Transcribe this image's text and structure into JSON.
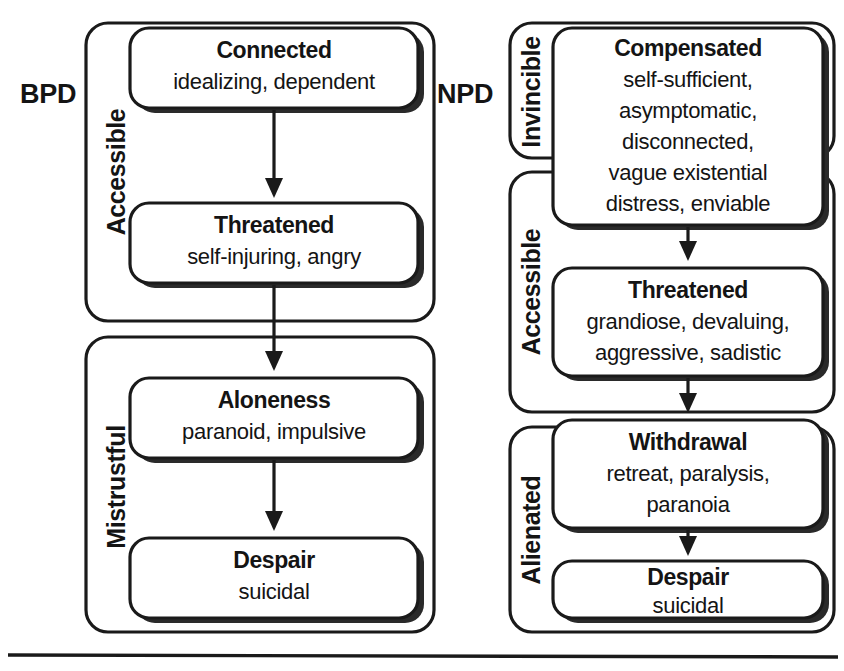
{
  "figure": {
    "bottom_rule": true
  },
  "columns": [
    {
      "id": "bpd",
      "label": "BPD",
      "groups": [
        {
          "id": "bpd-accessible",
          "label": "Accessible",
          "nodes": [
            {
              "id": "bpd-connected",
              "title": "Connected",
              "desc_lines": [
                "idealizing, dependent"
              ]
            },
            {
              "id": "bpd-threatened",
              "title": "Threatened",
              "desc_lines": [
                "self-injuring, angry"
              ]
            }
          ]
        },
        {
          "id": "bpd-mistrustful",
          "label": "Mistrustful",
          "nodes": [
            {
              "id": "bpd-aloneness",
              "title": "Aloneness",
              "desc_lines": [
                "paranoid, impulsive"
              ]
            },
            {
              "id": "bpd-despair",
              "title": "Despair",
              "desc_lines": [
                "suicidal"
              ]
            }
          ]
        }
      ]
    },
    {
      "id": "npd",
      "label": "NPD",
      "groups": [
        {
          "id": "npd-invincible",
          "label": "Invincible",
          "nodes": [
            {
              "id": "npd-compensated",
              "title": "Compensated",
              "desc_lines": [
                "self-sufficient,",
                "asymptomatic,",
                "disconnected,",
                "vague existential",
                "distress, enviable"
              ]
            }
          ]
        },
        {
          "id": "npd-accessible",
          "label": "Accessible",
          "nodes": [
            {
              "id": "npd-threatened",
              "title": "Threatened",
              "desc_lines": [
                "grandiose, devaluing,",
                "aggressive, sadistic"
              ]
            }
          ]
        },
        {
          "id": "npd-alienated",
          "label": "Alienated",
          "nodes": [
            {
              "id": "npd-withdrawal",
              "title": "Withdrawal",
              "desc_lines": [
                "retreat, paralysis,",
                "paranoia"
              ]
            },
            {
              "id": "npd-despair",
              "title": "Despair",
              "desc_lines": [
                "suicidal"
              ]
            }
          ]
        }
      ]
    }
  ],
  "flow_arrows": [
    {
      "id": "bpd-connected-to-threatened",
      "from": "Connected",
      "to": "Threatened"
    },
    {
      "id": "bpd-threatened-to-aloneness",
      "from": "Threatened",
      "to": "Aloneness"
    },
    {
      "id": "bpd-aloneness-to-despair",
      "from": "Aloneness",
      "to": "Despair"
    },
    {
      "id": "npd-compensated-to-threatened",
      "from": "Compensated",
      "to": "Threatened"
    },
    {
      "id": "npd-threatened-to-withdrawal",
      "from": "Threatened",
      "to": "Withdrawal"
    },
    {
      "id": "npd-withdrawal-to-despair",
      "from": "Withdrawal",
      "to": "Despair"
    }
  ],
  "colors": {
    "ink": "#1a1a1a",
    "paper": "#ffffff"
  }
}
